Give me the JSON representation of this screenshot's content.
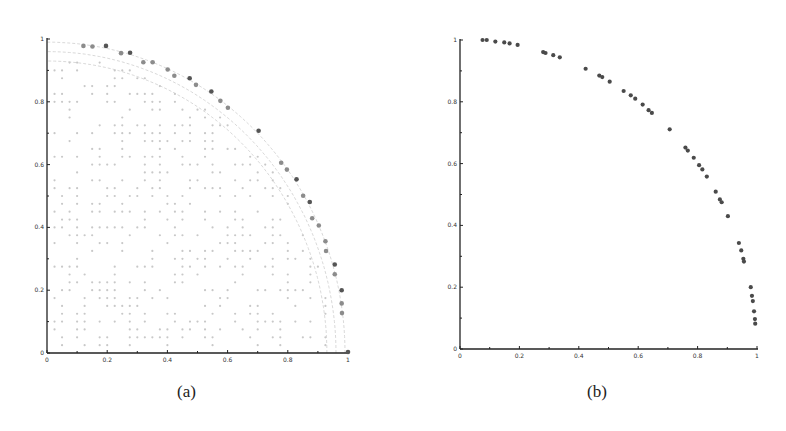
{
  "captions": {
    "a": "(a)",
    "b": "(b)"
  },
  "chart_data": [
    {
      "id": "a",
      "type": "scatter",
      "title": "",
      "xlabel": "",
      "ylabel": "",
      "xlim": [
        0,
        1
      ],
      "ylim": [
        0,
        1
      ],
      "xticks": [
        0,
        0.2,
        0.4,
        0.6,
        0.8,
        1
      ],
      "xtick_labels": [
        "0",
        "0.2",
        "0.4",
        "0.6",
        "0.8",
        "1"
      ],
      "yticks": [
        0,
        0.2,
        0.4,
        0.6,
        0.8,
        1
      ],
      "ytick_labels": [
        "0",
        "0.2",
        "0.4",
        "0.6",
        "0.8",
        "1"
      ],
      "grid": false,
      "legend": "none",
      "colors": {
        "front": "#8c8c8c",
        "front_dark": "#555555",
        "candidates": "#c8c8c8",
        "arcs": "#cfcfcf",
        "axis": "#222222"
      },
      "series": [
        {
          "name": "front",
          "points": [
            [
              0.121,
              0.978,
              0
            ],
            [
              0.151,
              0.976,
              0
            ],
            [
              0.196,
              0.978,
              1
            ],
            [
              0.246,
              0.955,
              0
            ],
            [
              0.276,
              0.956,
              1
            ],
            [
              0.32,
              0.926,
              0
            ],
            [
              0.351,
              0.926,
              0
            ],
            [
              0.401,
              0.903,
              0
            ],
            [
              0.423,
              0.883,
              0
            ],
            [
              0.474,
              0.875,
              1
            ],
            [
              0.495,
              0.854,
              0
            ],
            [
              0.546,
              0.833,
              1
            ],
            [
              0.576,
              0.803,
              0
            ],
            [
              0.601,
              0.781,
              0
            ],
            [
              0.703,
              0.708,
              1
            ],
            [
              0.778,
              0.606,
              0
            ],
            [
              0.797,
              0.584,
              0
            ],
            [
              0.829,
              0.553,
              1
            ],
            [
              0.851,
              0.501,
              0
            ],
            [
              0.873,
              0.481,
              1
            ],
            [
              0.881,
              0.429,
              0
            ],
            [
              0.903,
              0.406,
              0
            ],
            [
              0.925,
              0.356,
              0
            ],
            [
              0.927,
              0.325,
              0
            ],
            [
              0.956,
              0.282,
              1
            ],
            [
              0.956,
              0.251,
              0
            ],
            [
              0.979,
              0.2,
              1
            ],
            [
              0.979,
              0.158,
              0
            ],
            [
              0.98,
              0.127,
              0
            ],
            [
              1.0,
              0.003,
              1
            ]
          ]
        },
        {
          "name": "candidate-grid",
          "grid_step": 0.025,
          "max_radius": 0.95,
          "density": 0.38
        },
        {
          "name": "reference-arcs",
          "radii": [
            0.93,
            0.96,
            0.99
          ]
        }
      ]
    },
    {
      "id": "b",
      "type": "scatter",
      "title": "",
      "xlabel": "",
      "ylabel": "",
      "xlim": [
        0,
        1
      ],
      "ylim": [
        0,
        1
      ],
      "xticks": [
        0,
        0.2,
        0.4,
        0.6,
        0.8,
        1
      ],
      "xtick_labels": [
        "0",
        "0.2",
        "0.4",
        "0.6",
        "0.8",
        "1"
      ],
      "yticks": [
        0,
        0.2,
        0.4,
        0.6,
        0.8,
        1
      ],
      "ytick_labels": [
        "0",
        "0.2",
        "0.4",
        "0.6",
        "0.8",
        "1"
      ],
      "grid": false,
      "legend": "none",
      "colors": {
        "points": "#4a4a4a",
        "axis": "#222222"
      },
      "series": [
        {
          "name": "front",
          "points": [
            [
              0.076,
              1.0
            ],
            [
              0.09,
              1.0
            ],
            [
              0.119,
              0.995
            ],
            [
              0.149,
              0.992
            ],
            [
              0.167,
              0.989
            ],
            [
              0.194,
              0.984
            ],
            [
              0.28,
              0.961
            ],
            [
              0.288,
              0.958
            ],
            [
              0.314,
              0.951
            ],
            [
              0.336,
              0.944
            ],
            [
              0.423,
              0.907
            ],
            [
              0.469,
              0.885
            ],
            [
              0.479,
              0.88
            ],
            [
              0.504,
              0.865
            ],
            [
              0.551,
              0.835
            ],
            [
              0.575,
              0.821
            ],
            [
              0.59,
              0.81
            ],
            [
              0.615,
              0.791
            ],
            [
              0.635,
              0.773
            ],
            [
              0.646,
              0.764
            ],
            [
              0.706,
              0.711
            ],
            [
              0.759,
              0.652
            ],
            [
              0.767,
              0.642
            ],
            [
              0.787,
              0.619
            ],
            [
              0.805,
              0.595
            ],
            [
              0.816,
              0.581
            ],
            [
              0.831,
              0.558
            ],
            [
              0.861,
              0.509
            ],
            [
              0.875,
              0.484
            ],
            [
              0.881,
              0.475
            ],
            [
              0.902,
              0.43
            ],
            [
              0.939,
              0.343
            ],
            [
              0.947,
              0.319
            ],
            [
              0.954,
              0.292
            ],
            [
              0.956,
              0.283
            ],
            [
              0.979,
              0.2
            ],
            [
              0.983,
              0.172
            ],
            [
              0.986,
              0.155
            ],
            [
              0.99,
              0.122
            ],
            [
              0.993,
              0.097
            ],
            [
              0.994,
              0.082
            ]
          ]
        }
      ]
    }
  ]
}
